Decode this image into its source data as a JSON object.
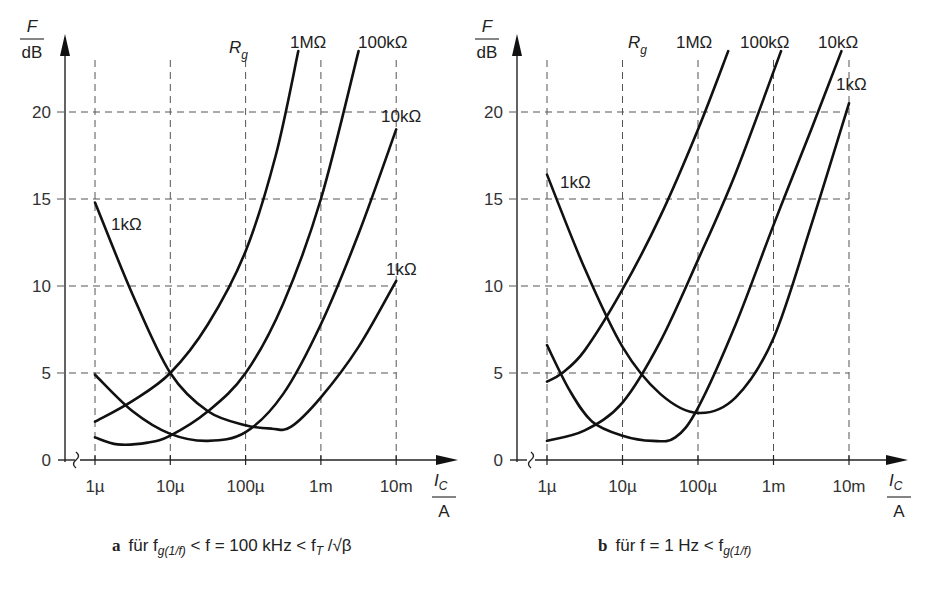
{
  "chart_data": [
    {
      "type": "line",
      "panel": "a",
      "title": "für f_g(1/f) < f = 100 kHz < f_T / √β",
      "xlabel": "I_C / A",
      "ylabel": "F / dB",
      "xscale": "log",
      "x_ticks": [
        "1µ",
        "10µ",
        "100µ",
        "1m",
        "10m"
      ],
      "y_ticks": [
        0,
        5,
        10,
        15,
        20
      ],
      "ylim": [
        0,
        23.5
      ],
      "legend_title": "R_g",
      "grid": true,
      "series": [
        {
          "name": "1MΩ",
          "x_decade": [
            0,
            0.5,
            1,
            1.5,
            2,
            2.4,
            2.7
          ],
          "values": [
            2.2,
            3.4,
            5.0,
            7.8,
            12.0,
            17.5,
            23.5
          ]
        },
        {
          "name": "100kΩ",
          "x_decade": [
            0,
            0.3,
            0.7,
            1,
            1.5,
            2,
            2.5,
            3,
            3.5
          ],
          "values": [
            1.3,
            0.9,
            1.0,
            1.4,
            2.8,
            5.0,
            9.0,
            15.0,
            23.5
          ]
        },
        {
          "name": "10kΩ",
          "x_decade": [
            0,
            0.5,
            1,
            1.5,
            2,
            2.5,
            3,
            3.5,
            4
          ],
          "values": [
            4.9,
            2.8,
            1.5,
            1.1,
            1.6,
            3.8,
            7.8,
            13.0,
            19.0
          ]
        },
        {
          "name": "1kΩ",
          "x_decade": [
            0,
            0.5,
            1,
            1.5,
            2,
            2.35,
            2.6,
            3,
            3.5,
            4
          ],
          "values": [
            14.8,
            9.5,
            5.0,
            2.8,
            2.0,
            1.8,
            1.9,
            3.6,
            6.5,
            10.3
          ]
        }
      ]
    },
    {
      "type": "line",
      "panel": "b",
      "title": "für f = 1 Hz < f_g(1/f)",
      "xlabel": "I_C / A",
      "ylabel": "F / dB",
      "xscale": "log",
      "x_ticks": [
        "1µ",
        "10µ",
        "100µ",
        "1m",
        "10m"
      ],
      "y_ticks": [
        0,
        5,
        10,
        15,
        20
      ],
      "ylim": [
        0,
        23.5
      ],
      "legend_title": "R_g",
      "grid": true,
      "series": [
        {
          "name": "1MΩ",
          "x_decade": [
            0,
            0.2,
            0.5,
            1,
            1.5,
            2,
            2.4
          ],
          "values": [
            4.5,
            5.0,
            6.3,
            9.8,
            14.0,
            19.0,
            23.5
          ]
        },
        {
          "name": "100kΩ",
          "x_decade": [
            0,
            0.5,
            1,
            1.5,
            2,
            2.5,
            3.1
          ],
          "values": [
            1.1,
            1.7,
            3.3,
            6.8,
            11.5,
            16.5,
            23.5
          ]
        },
        {
          "name": "10kΩ",
          "x_decade": [
            0,
            0.3,
            0.6,
            1,
            1.4,
            1.7,
            2,
            2.5,
            3,
            3.5,
            3.9
          ],
          "values": [
            6.6,
            4.0,
            2.2,
            1.4,
            1.1,
            1.3,
            3.0,
            7.8,
            13.5,
            19.0,
            23.5
          ]
        },
        {
          "name": "1kΩ",
          "x_decade": [
            0,
            0.5,
            1,
            1.5,
            2,
            2.5,
            3,
            3.5,
            4
          ],
          "values": [
            16.4,
            11.0,
            6.5,
            3.8,
            2.7,
            3.6,
            7.0,
            13.5,
            20.5
          ]
        }
      ]
    }
  ],
  "panels": {
    "a": {
      "letter": "a",
      "caption": "für f",
      "caption_sub": "g(1/f)",
      "caption_rest": " < f = 100 kHz < f",
      "caption_sub2": "T",
      "caption_end": " /√β",
      "y_label_top": "F",
      "y_label_bottom": "dB",
      "x_label_top": "I",
      "x_label_sub": "C",
      "x_label_bottom": "A",
      "legend_title": "R",
      "legend_sub": "g",
      "labels": [
        "1MΩ",
        "100kΩ",
        "10kΩ",
        "1kΩ",
        "1kΩ"
      ]
    },
    "b": {
      "letter": "b",
      "caption": "für f = 1 Hz < f",
      "caption_sub": "g(1/f)",
      "y_label_top": "F",
      "y_label_bottom": "dB",
      "x_label_top": "I",
      "x_label_sub": "C",
      "x_label_bottom": "A",
      "legend_title": "R",
      "legend_sub": "g",
      "labels": [
        "1MΩ",
        "100kΩ",
        "10kΩ",
        "1kΩ",
        "1kΩ"
      ]
    }
  },
  "ticks": {
    "x": [
      "1µ",
      "10µ",
      "100µ",
      "1m",
      "10m"
    ],
    "y": [
      "0",
      "5",
      "10",
      "15",
      "20"
    ]
  }
}
